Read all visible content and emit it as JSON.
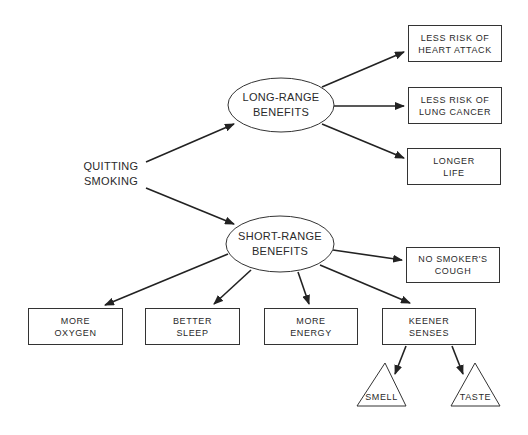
{
  "diagram": {
    "root": {
      "line1": "QUITTING",
      "line2": "SMOKING"
    },
    "long_range": {
      "line1": "LONG-RANGE",
      "line2": "BENEFITS",
      "children": [
        {
          "line1": "LESS RISK OF",
          "line2": "HEART ATTACK"
        },
        {
          "line1": "LESS RISK OF",
          "line2": "LUNG CANCER"
        },
        {
          "line1": "LONGER",
          "line2": "LIFE"
        }
      ]
    },
    "short_range": {
      "line1": "SHORT-RANGE",
      "line2": "BENEFITS",
      "children": [
        {
          "line1": "NO SMOKER'S",
          "line2": "COUGH"
        },
        {
          "line1": "MORE",
          "line2": "OXYGEN"
        },
        {
          "line1": "BETTER",
          "line2": "SLEEP"
        },
        {
          "line1": "MORE",
          "line2": "ENERGY"
        },
        {
          "line1": "KEENER",
          "line2": "SENSES"
        }
      ]
    },
    "senses": [
      {
        "label": "SMELL"
      },
      {
        "label": "TASTE"
      }
    ],
    "colors": {
      "stroke": "#333333",
      "background": "#ffffff",
      "text": "#2a2a2a"
    }
  }
}
